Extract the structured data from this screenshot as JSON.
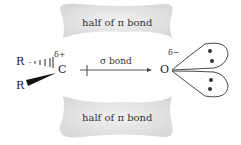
{
  "diagram": {
    "top_lobe_label": "half of π bond",
    "bottom_lobe_label": "half of π bond",
    "sigma_label": "σ bond",
    "atoms": {
      "carbon": "C",
      "oxygen": "O",
      "r_top": "R",
      "r_bottom": "R"
    },
    "charges": {
      "carbon": "δ+",
      "oxygen": "δ−"
    },
    "lone_pairs": 2,
    "colors": {
      "pi_lobe": "#e8e8e8",
      "line": "#333333"
    }
  }
}
